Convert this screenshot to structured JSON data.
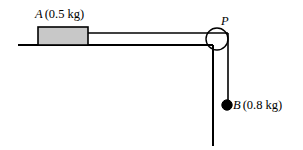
{
  "figure": {
    "background_color": "#ffffff",
    "stroke_color": "#000000",
    "block_fill_color": "#c8c8c8",
    "width": 303,
    "height": 150
  },
  "labels": {
    "block_a": {
      "symbol": "A",
      "value": "(0.5 kg)",
      "full": "A (0.5 kg)"
    },
    "pulley_p": {
      "symbol": "P",
      "full": "P"
    },
    "mass_b": {
      "symbol": "B",
      "value": "(0.8 kg)",
      "full": "B (0.8 kg)"
    }
  },
  "geometry": {
    "table_surface": {
      "x1": 18,
      "y1": 45,
      "x2": 213,
      "y2": 45
    },
    "block": {
      "x": 38,
      "y": 27,
      "width": 50,
      "height": 18
    },
    "string_horizontal": {
      "x1": 88,
      "y1": 33,
      "x2": 228,
      "y2": 33
    },
    "pulley": {
      "cx": 217,
      "cy": 39,
      "r": 11
    },
    "wall_vertical": {
      "x1": 213,
      "y1": 45,
      "x2": 213,
      "y2": 146
    },
    "string_vertical": {
      "x1": 228,
      "y1": 33,
      "x2": 228,
      "y2": 105
    },
    "mass_b_marker": {
      "cx": 227,
      "cy": 105,
      "r": 5
    }
  }
}
